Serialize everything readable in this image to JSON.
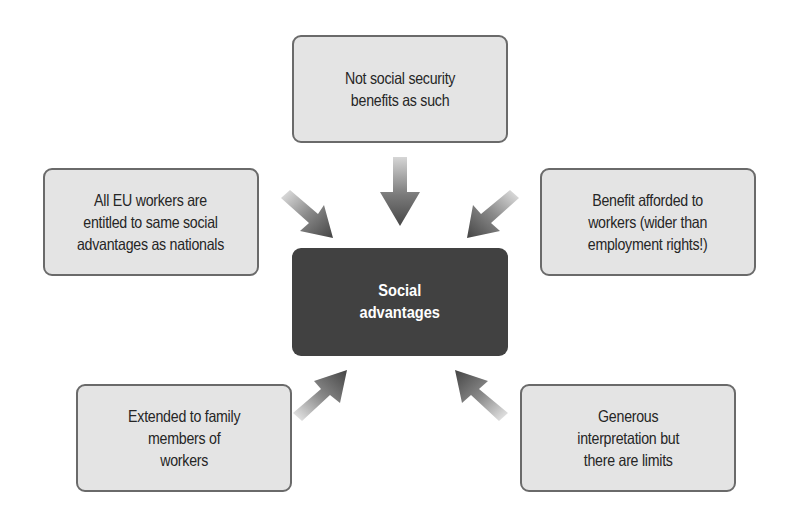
{
  "diagram": {
    "title": "Social advantages",
    "center": {
      "label": "Social\nadvantages",
      "fill": "#414141",
      "text_color": "#ffffff"
    },
    "nodes": [
      {
        "id": "top",
        "label": "Not social security\nbenefits as such",
        "arrow_direction": "down"
      },
      {
        "id": "left",
        "label": "All EU workers are\nentitled to same social\nadvantages as nationals",
        "arrow_direction": "down-right"
      },
      {
        "id": "right",
        "label": "Benefit afforded to\nworkers (wider than\nemployment rights!)",
        "arrow_direction": "down-left"
      },
      {
        "id": "bottom-left",
        "label": "Extended to family\nmembers of\nworkers",
        "arrow_direction": "up-right"
      },
      {
        "id": "bottom-right",
        "label": "Generous\ninterpretation but\nthere are limits",
        "arrow_direction": "up-left"
      }
    ],
    "colors": {
      "node_fill": "#e4e4e4",
      "node_border": "#6a6a6a",
      "node_text": "#262626",
      "arrow_dark": "#4a4a4a",
      "arrow_light": "#e8e8e8"
    }
  }
}
